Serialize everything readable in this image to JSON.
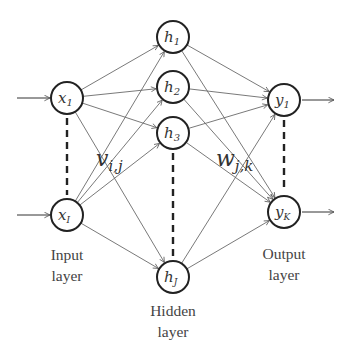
{
  "diagram": {
    "type": "feedforward-neural-network",
    "layers": {
      "input": {
        "label_line1": "Input",
        "label_line2": "layer",
        "nodes": [
          {
            "id": "x1",
            "symbol": "x",
            "subscript": "1",
            "cx": 67,
            "cy": 98
          },
          {
            "id": "xI",
            "symbol": "x",
            "subscript": "I",
            "cx": 67,
            "cy": 215
          }
        ]
      },
      "hidden": {
        "label_line1": "Hidden",
        "label_line2": "layer",
        "nodes": [
          {
            "id": "h1",
            "symbol": "h",
            "subscript": "1",
            "cx": 173,
            "cy": 37
          },
          {
            "id": "h2",
            "symbol": "h",
            "subscript": "2",
            "cx": 173,
            "cy": 87
          },
          {
            "id": "h3",
            "symbol": "h",
            "subscript": "3",
            "cx": 173,
            "cy": 133
          },
          {
            "id": "hJ",
            "symbol": "h",
            "subscript": "J",
            "cx": 173,
            "cy": 277
          }
        ]
      },
      "output": {
        "label_line1": "Output",
        "label_line2": "layer",
        "nodes": [
          {
            "id": "y1",
            "symbol": "y",
            "subscript": "1",
            "cx": 284,
            "cy": 100
          },
          {
            "id": "yK",
            "symbol": "y",
            "subscript": "K",
            "cx": 284,
            "cy": 212
          }
        ]
      }
    },
    "weights": {
      "input_to_hidden": {
        "symbol": "v",
        "subscript": "i,j"
      },
      "hidden_to_output": {
        "symbol": "w",
        "subscript": "j,k"
      }
    },
    "node_radius": 16,
    "colors": {
      "node_stroke": "#222222",
      "edge": "#6a6a6a",
      "text": "#333333",
      "background": "#ffffff"
    }
  }
}
